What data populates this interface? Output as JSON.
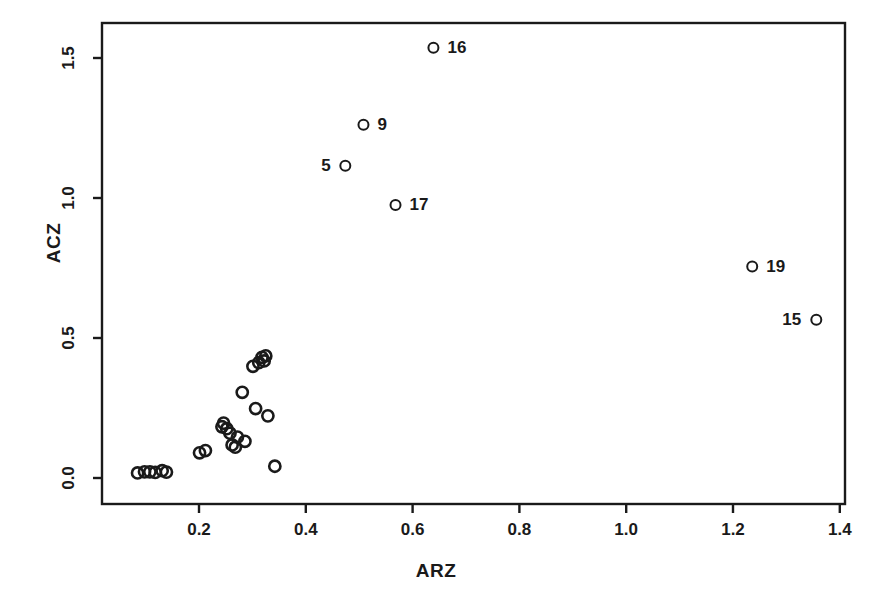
{
  "chart_data": {
    "type": "scatter",
    "title": "",
    "xlabel": "ARZ",
    "ylabel": "ACZ",
    "xlim": [
      0.06,
      1.43
    ],
    "ylim": [
      -0.02,
      1.62
    ],
    "xticks": [
      0.2,
      0.4,
      0.6,
      0.8,
      1.0,
      1.2,
      1.4
    ],
    "xticklabels": [
      "0.2",
      "0.4",
      "0.6",
      "0.8",
      "1.0",
      "1.2",
      "1.4"
    ],
    "yticks": [
      0.0,
      0.5,
      1.0,
      1.5
    ],
    "yticklabels": [
      "0.0",
      "0.5",
      "1.0",
      "1.5"
    ],
    "grid": false,
    "legend": null,
    "marker": "open-circle",
    "marker_color": "#1a1a1a",
    "points": [
      {
        "x": 0.085,
        "y": 0.018,
        "label": ""
      },
      {
        "x": 0.098,
        "y": 0.022,
        "label": ""
      },
      {
        "x": 0.108,
        "y": 0.022,
        "label": ""
      },
      {
        "x": 0.118,
        "y": 0.02,
        "label": ""
      },
      {
        "x": 0.131,
        "y": 0.026,
        "label": ""
      },
      {
        "x": 0.139,
        "y": 0.021,
        "label": ""
      },
      {
        "x": 0.201,
        "y": 0.09,
        "label": ""
      },
      {
        "x": 0.212,
        "y": 0.098,
        "label": ""
      },
      {
        "x": 0.243,
        "y": 0.183,
        "label": ""
      },
      {
        "x": 0.246,
        "y": 0.196,
        "label": ""
      },
      {
        "x": 0.252,
        "y": 0.176,
        "label": ""
      },
      {
        "x": 0.258,
        "y": 0.16,
        "label": ""
      },
      {
        "x": 0.262,
        "y": 0.118,
        "label": ""
      },
      {
        "x": 0.268,
        "y": 0.11,
        "label": ""
      },
      {
        "x": 0.272,
        "y": 0.146,
        "label": ""
      },
      {
        "x": 0.281,
        "y": 0.306,
        "label": ""
      },
      {
        "x": 0.286,
        "y": 0.131,
        "label": ""
      },
      {
        "x": 0.301,
        "y": 0.399,
        "label": ""
      },
      {
        "x": 0.306,
        "y": 0.248,
        "label": ""
      },
      {
        "x": 0.312,
        "y": 0.412,
        "label": ""
      },
      {
        "x": 0.318,
        "y": 0.431,
        "label": ""
      },
      {
        "x": 0.322,
        "y": 0.418,
        "label": ""
      },
      {
        "x": 0.325,
        "y": 0.436,
        "label": ""
      },
      {
        "x": 0.329,
        "y": 0.222,
        "label": ""
      },
      {
        "x": 0.342,
        "y": 0.042,
        "label": ""
      },
      {
        "x": 0.474,
        "y": 1.115,
        "label": "5",
        "label_side": "left"
      },
      {
        "x": 0.508,
        "y": 1.262,
        "label": "9",
        "label_side": "right"
      },
      {
        "x": 0.568,
        "y": 0.975,
        "label": "17",
        "label_side": "right"
      },
      {
        "x": 0.639,
        "y": 1.537,
        "label": "16",
        "label_side": "right"
      },
      {
        "x": 1.236,
        "y": 0.755,
        "label": "19",
        "label_side": "right"
      },
      {
        "x": 1.356,
        "y": 0.565,
        "label": "15",
        "label_side": "left"
      }
    ]
  },
  "axes": {
    "x_axis_title": "ARZ",
    "y_axis_title": "ACZ"
  },
  "colors": {
    "frame": "#1a1a1a",
    "marker": "#1a1a1a",
    "background": "#ffffff"
  }
}
